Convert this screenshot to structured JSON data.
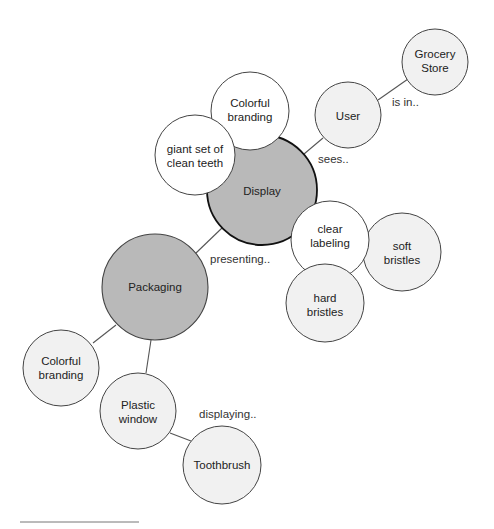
{
  "diagram": {
    "type": "bubble-map",
    "colors": {
      "central_fill": "#b9b9b9",
      "light_fill": "#f1f1f1",
      "white_fill": "#ffffff",
      "stroke": "#444444",
      "edge": "#555555"
    },
    "nodes": [
      {
        "id": "grocery",
        "lines": [
          "Grocery",
          "Store"
        ],
        "fill": "light"
      },
      {
        "id": "user",
        "lines": [
          "User"
        ],
        "fill": "light"
      },
      {
        "id": "colorful_top",
        "lines": [
          "Colorful",
          "branding"
        ],
        "fill": "white"
      },
      {
        "id": "teeth",
        "lines": [
          "giant set of",
          "clean teeth"
        ],
        "fill": "white"
      },
      {
        "id": "display",
        "lines": [
          "Display"
        ],
        "fill": "central"
      },
      {
        "id": "clear",
        "lines": [
          "clear",
          "labeling"
        ],
        "fill": "white"
      },
      {
        "id": "soft",
        "lines": [
          "soft",
          "bristles"
        ],
        "fill": "light"
      },
      {
        "id": "hard",
        "lines": [
          "hard",
          "bristles"
        ],
        "fill": "light"
      },
      {
        "id": "packaging",
        "lines": [
          "Packaging"
        ],
        "fill": "central"
      },
      {
        "id": "colorful_bottom",
        "lines": [
          "Colorful",
          "branding"
        ],
        "fill": "light"
      },
      {
        "id": "plastic",
        "lines": [
          "Plastic",
          "window"
        ],
        "fill": "light"
      },
      {
        "id": "toothbrush",
        "lines": [
          "Toothbrush"
        ],
        "fill": "light"
      }
    ],
    "edges": [
      {
        "from": "user",
        "to": "grocery",
        "label": "is in.."
      },
      {
        "from": "display",
        "to": "user",
        "label": "sees.."
      },
      {
        "from": "packaging",
        "to": "display",
        "label": "presenting.."
      },
      {
        "from": "packaging",
        "to": "colorful_bottom",
        "label": ""
      },
      {
        "from": "packaging",
        "to": "plastic",
        "label": ""
      },
      {
        "from": "plastic",
        "to": "toothbrush",
        "label": "displaying.."
      }
    ]
  }
}
